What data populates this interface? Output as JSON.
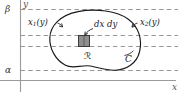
{
  "figure": {
    "name": "double-integral-region-diagram",
    "background_color": "#ffffff"
  },
  "axes": {
    "x_label": "x",
    "y_label": "y",
    "axis_color": "#9a9a9a",
    "label_color": "#555555"
  },
  "bounds": {
    "upper_label": "β",
    "lower_label": "α",
    "guide_color": "#8c8c8c"
  },
  "annotations": {
    "left_boundary": {
      "base": "x",
      "sub": "1",
      "arg": "(y)"
    },
    "right_boundary": {
      "base": "x",
      "sub": "2",
      "arg": "(y)"
    },
    "area_element": "dx dy",
    "region": "ℛ",
    "curve": "C"
  },
  "element_box": {
    "fill_color": "#8e8e8e",
    "stroke_color": "#3a3a3a"
  },
  "curve": {
    "stroke_color": "#1a1a1a",
    "fill_color": "none"
  }
}
